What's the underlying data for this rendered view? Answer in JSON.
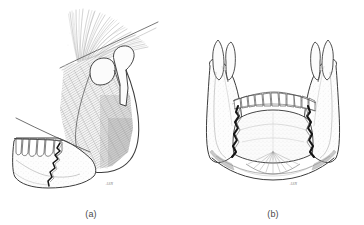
{
  "figure": {
    "type": "anatomical-line-illustration",
    "background_color": "#ffffff",
    "ink_color": "#3c3c3c",
    "shade_color": "#b9b9b9",
    "fracture_color": "#1a1a1a",
    "panels": [
      {
        "id": "a",
        "caption": "(a)",
        "view": "lateral oblique view of mandible",
        "signature": "ASN",
        "parts": [
          {
            "name": "temporalis-muscle-fibers",
            "description": "fan of fine fibers radiating superiorly"
          },
          {
            "name": "coronoid-process",
            "description": "pointed anterior process of ramus"
          },
          {
            "name": "condylar-process",
            "description": "rounded head superior-posterior"
          },
          {
            "name": "sigmoid-notch",
            "description": "concavity between coronoid and condyle"
          },
          {
            "name": "masseter-muscle",
            "description": "shaded quadrilateral over ramus and angle"
          },
          {
            "name": "mandibular-body",
            "description": "horizontal body bearing teeth"
          },
          {
            "name": "tooth-row",
            "description": "row of crowns along alveolar margin"
          },
          {
            "name": "fracture-line",
            "description": "jagged dark break through the body"
          }
        ]
      },
      {
        "id": "b",
        "caption": "(b)",
        "view": "anterior (frontal) view of mandible",
        "signature": "ASN",
        "parts": [
          {
            "name": "left-ramus",
            "description": "ascending ramus, left side"
          },
          {
            "name": "right-ramus",
            "description": "ascending ramus, right side"
          },
          {
            "name": "left-coronoid-process",
            "description": "pointed process, left"
          },
          {
            "name": "right-coronoid-process",
            "description": "pointed process, right"
          },
          {
            "name": "left-condyle",
            "description": "condylar head, left"
          },
          {
            "name": "right-condyle",
            "description": "condylar head, right"
          },
          {
            "name": "tooth-row",
            "description": "anterior arch of incisors, canines and premolars"
          },
          {
            "name": "symphysis-segment",
            "description": "central anterior segment of mandible"
          },
          {
            "name": "left-fracture-line",
            "description": "dark bilateral fracture, left body/angle"
          },
          {
            "name": "right-fracture-line",
            "description": "dark bilateral fracture, right body/angle"
          },
          {
            "name": "suprahyoid-muscle-fan",
            "description": "fan of fibers at inferior symphysis"
          },
          {
            "name": "inferior-border",
            "description": "lower border of mandible"
          }
        ]
      }
    ]
  }
}
